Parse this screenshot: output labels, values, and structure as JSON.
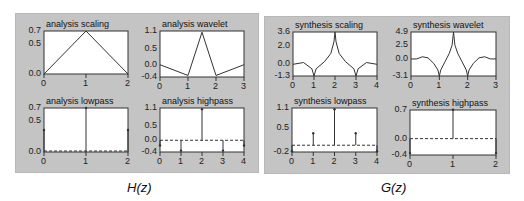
{
  "panels": [
    {
      "caption": "H(z)"
    },
    {
      "caption": "G(z)"
    }
  ],
  "chart_data": [
    {
      "type": "line",
      "title": "analysis scaling",
      "x": [
        0,
        1,
        2
      ],
      "values": [
        0.0,
        0.707,
        0.0
      ],
      "xticks": [
        "0",
        "1",
        "2"
      ],
      "yticks": [
        "0.7",
        "0.5",
        "0.0"
      ],
      "ylim": [
        0.0,
        0.707
      ],
      "xlim": [
        0,
        2
      ]
    },
    {
      "type": "line",
      "title": "analysis wavelet",
      "x": [
        0,
        1,
        1.5,
        2,
        3
      ],
      "values": [
        0.0,
        -0.35,
        1.06,
        -0.35,
        0.0
      ],
      "xticks": [
        "0",
        "1",
        "2",
        "3"
      ],
      "yticks": [
        "1.1",
        "0.5",
        "0.0",
        "-0.4"
      ],
      "ylim": [
        -0.4,
        1.1
      ],
      "xlim": [
        0,
        3
      ]
    },
    {
      "type": "stem",
      "title": "analysis lowpass",
      "x": [
        0,
        1,
        2
      ],
      "values": [
        0.354,
        0.707,
        0.354
      ],
      "xticks": [
        "0",
        "1",
        "2"
      ],
      "yticks": [
        "0.7",
        "0.5",
        "0.0"
      ],
      "ylim": [
        0.0,
        0.707
      ],
      "xlim": [
        0,
        2
      ]
    },
    {
      "type": "stem",
      "title": "analysis highpass",
      "x": [
        0,
        1,
        2,
        3,
        4
      ],
      "values": [
        -0.177,
        -0.354,
        1.061,
        -0.354,
        -0.177
      ],
      "xticks": [
        "0",
        "1",
        "2",
        "3",
        "4"
      ],
      "yticks": [
        "1.1",
        "0.5",
        "0.0",
        "-0.4"
      ],
      "ylim": [
        -0.4,
        1.1
      ],
      "xlim": [
        0,
        4
      ]
    },
    {
      "type": "line",
      "title": "synthesis scaling",
      "x_range": [
        0,
        4
      ],
      "key_points": [
        [
          0,
          0.0
        ],
        [
          0.5,
          0.2
        ],
        [
          0.9,
          -0.5
        ],
        [
          1,
          -1.3
        ],
        [
          1.1,
          -0.5
        ],
        [
          1.5,
          0.3
        ],
        [
          1.8,
          1.2
        ],
        [
          1.95,
          2.5
        ],
        [
          2,
          3.6
        ],
        [
          2.05,
          2.5
        ],
        [
          2.2,
          1.2
        ],
        [
          2.5,
          0.3
        ],
        [
          2.9,
          -0.5
        ],
        [
          3,
          -1.3
        ],
        [
          3.1,
          -0.5
        ],
        [
          3.5,
          0.2
        ],
        [
          4,
          0.0
        ]
      ],
      "xticks": [
        "0",
        "1",
        "2",
        "3",
        "4"
      ],
      "yticks": [
        "3.6",
        "2.0",
        "0.0",
        "-1.3"
      ],
      "ylim": [
        -1.3,
        3.6
      ],
      "xlim": [
        0,
        4
      ]
    },
    {
      "type": "line",
      "title": "synthesis wavelet",
      "x_range": [
        0,
        3
      ],
      "key_points": [
        [
          0,
          0.0
        ],
        [
          0.2,
          0.0
        ],
        [
          0.4,
          0.4
        ],
        [
          0.6,
          0.2
        ],
        [
          0.8,
          -0.8
        ],
        [
          0.95,
          -2.0
        ],
        [
          1,
          -3.1
        ],
        [
          1.05,
          -2.0
        ],
        [
          1.2,
          -0.5
        ],
        [
          1.35,
          1.0
        ],
        [
          1.45,
          2.5
        ],
        [
          1.5,
          4.9
        ],
        [
          1.55,
          2.5
        ],
        [
          1.65,
          1.0
        ],
        [
          1.8,
          -0.5
        ],
        [
          1.95,
          -2.0
        ],
        [
          2,
          -3.1
        ],
        [
          2.05,
          -2.0
        ],
        [
          2.2,
          -0.8
        ],
        [
          2.4,
          0.2
        ],
        [
          2.6,
          0.4
        ],
        [
          2.8,
          0.0
        ],
        [
          3,
          0.0
        ]
      ],
      "xticks": [
        "0",
        "1",
        "2",
        "3"
      ],
      "yticks": [
        "4.9",
        "2.5",
        "0.0",
        "-3.1"
      ],
      "ylim": [
        -3.1,
        4.9
      ],
      "xlim": [
        0,
        3
      ]
    },
    {
      "type": "stem",
      "title": "synthesis lowpass",
      "x": [
        0,
        1,
        2,
        3,
        4
      ],
      "values": [
        -0.177,
        0.354,
        1.061,
        0.354,
        -0.177
      ],
      "xticks": [
        "0",
        "1",
        "2",
        "3",
        "4"
      ],
      "yticks": [
        "1.1",
        "0.5",
        "-0.2"
      ],
      "ylim": [
        -0.2,
        1.1
      ],
      "xlim": [
        0,
        4
      ]
    },
    {
      "type": "stem",
      "title": "synthesis highpass",
      "x": [
        0,
        1,
        2
      ],
      "values": [
        -0.354,
        0.707,
        -0.354
      ],
      "xticks": [
        "0",
        "1",
        "2"
      ],
      "yticks": [
        "0.7",
        "0.0",
        "-0.4"
      ],
      "ylim": [
        -0.4,
        0.7
      ],
      "xlim": [
        0,
        2
      ]
    }
  ]
}
